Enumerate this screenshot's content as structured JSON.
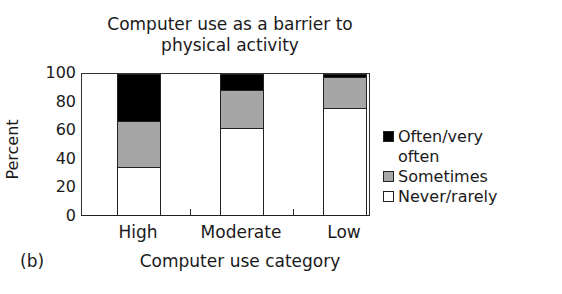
{
  "chart_data": {
    "type": "bar",
    "stacked": true,
    "title": "Computer use as a barrier to physical activity",
    "title_lines": [
      "Computer use as a barrier to",
      "physical activity"
    ],
    "xlabel": "Computer use category",
    "ylabel": "Percent",
    "panel_label": "(b)",
    "ylim": [
      0,
      100
    ],
    "yticks": [
      0,
      20,
      40,
      60,
      80,
      100
    ],
    "categories": [
      "High",
      "Moderate",
      "Low"
    ],
    "series": [
      {
        "name": "Never/rarely",
        "color": "#ffffff",
        "values": [
          33,
          61,
          75
        ]
      },
      {
        "name": "Sometimes",
        "color": "#a6a6a6",
        "values": [
          33,
          27,
          22
        ]
      },
      {
        "name": "Often/very often",
        "color": "#000000",
        "values": [
          34,
          12,
          3
        ]
      }
    ],
    "legend_position": "right",
    "legend_order": [
      "Often/very often",
      "Sometimes",
      "Never/rarely"
    ],
    "grid": false
  },
  "legend": {
    "often_line1": "Often/very",
    "often_line2": "often",
    "sometimes": "Sometimes",
    "never": "Never/rarely"
  }
}
